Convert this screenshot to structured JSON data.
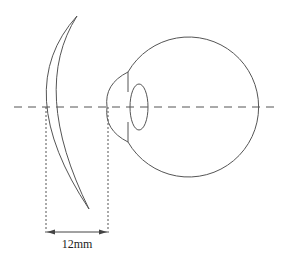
{
  "diagram": {
    "colors": {
      "stroke": "#555555",
      "dash": "#555555",
      "text": "#222222"
    },
    "measurement": {
      "label": "12mm"
    },
    "elements": [
      {
        "id": "corrective-lens",
        "description": "Meniscus lens shown in cross-section to the left of the eye"
      },
      {
        "id": "eyeball",
        "description": "Eye globe with cornea, iris line and crystalline lens"
      },
      {
        "id": "optical-axis",
        "description": "Horizontal dashed optical axis line"
      },
      {
        "id": "vertex-distance",
        "description": "Dimension line between lens back surface and cornea apex"
      }
    ]
  }
}
